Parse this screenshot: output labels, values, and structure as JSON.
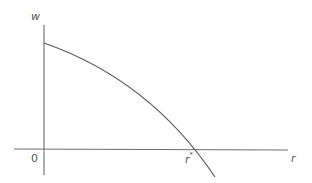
{
  "diagram": {
    "type": "function-graph",
    "y_axis_label": "w",
    "x_axis_label": "r",
    "origin_label": "0",
    "root_label": "r",
    "root_label_superscript": "*"
  },
  "colors": {
    "background": "#ffffff",
    "axis": "#6d6d6d",
    "curve": "#5a5a5a",
    "text": "#555555"
  }
}
